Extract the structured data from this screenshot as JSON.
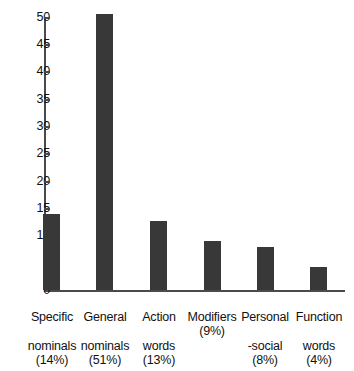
{
  "chart_data": {
    "type": "bar",
    "title": "",
    "subtitle": "",
    "xlabel": "",
    "ylabel": "",
    "ylim": [
      0,
      50
    ],
    "grid": false,
    "legend": null,
    "categories": [
      "Specific nominals",
      "General nominals",
      "Action words",
      "Modifiers",
      "Personal -social",
      "Function words"
    ],
    "category_lines": [
      [
        "Specific",
        "nominals"
      ],
      [
        "General",
        "nominals"
      ],
      [
        "Action",
        "words"
      ],
      [
        "Modifiers",
        ""
      ],
      [
        "Personal",
        "-social"
      ],
      [
        "Function",
        "words"
      ]
    ],
    "percent_labels": [
      "(14%)",
      "(51%)",
      "(13%)",
      "(9%)",
      "(8%)",
      "(4%)"
    ],
    "values": [
      14,
      50.5,
      12.7,
      9,
      7.8,
      4.2
    ],
    "yticks": [
      0,
      5,
      10,
      15,
      20,
      25,
      30,
      35,
      40,
      45,
      50
    ],
    "ytick_labels": [
      "0",
      "5",
      "10",
      "15",
      "20",
      "25",
      "30",
      "35",
      "40",
      "45",
      "50"
    ],
    "bar_color": "#383838",
    "axis_color": "#4a4a4a",
    "background_color": "#ffffff"
  },
  "bars": [
    {
      "label_line1": "Specific",
      "label_line2": "nominals",
      "pct": "(14%)",
      "value": 14
    },
    {
      "label_line1": "General",
      "label_line2": "nominals",
      "pct": "(51%)",
      "value": 50.5
    },
    {
      "label_line1": "Action",
      "label_line2": "words",
      "pct": "(13%)",
      "value": 12.7
    },
    {
      "label_line1": "Modifiers",
      "label_line2": "",
      "pct": "(9%)",
      "value": 9
    },
    {
      "label_line1": "Personal",
      "label_line2": "-social",
      "pct": "(8%)",
      "value": 7.8
    },
    {
      "label_line1": "Function",
      "label_line2": "words",
      "pct": "(4%)",
      "value": 4.2
    }
  ],
  "yaxis": {
    "labels": [
      "50",
      "45",
      "40",
      "35",
      "30",
      "25",
      "20",
      "15",
      "10",
      "5",
      "0"
    ]
  }
}
